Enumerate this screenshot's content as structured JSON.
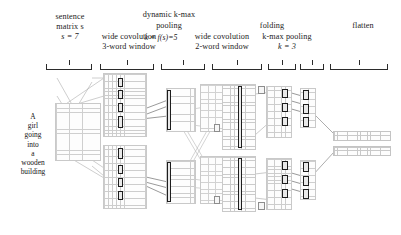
{
  "figure": {
    "type": "neural-network-architecture-diagram",
    "title_labels": {
      "sentence_matrix_l1": "sentence",
      "sentence_matrix_l2": "matrix s",
      "sentence_matrix_l3": "s = 7",
      "wide_conv_1_l1": "wide covolution",
      "wide_conv_1_l2": "3-word window",
      "dynamic_kmax_l1": "dynamic k-max",
      "dynamic_kmax_l2": "pooling",
      "dynamic_kmax_l3": "k = f(s)=5",
      "wide_conv_2_l1": "wide covolution",
      "wide_conv_2_l2": "2-word window",
      "folding": "folding",
      "kmax_pooling_l1": "k-max pooling",
      "kmax_pooling_l2": "k = 3",
      "flatten": "flatten"
    },
    "sentence_words": [
      "A",
      "girl",
      "going",
      "into",
      "a",
      "wooden",
      "building"
    ],
    "stages": [
      {
        "name": "sentence-matrix",
        "columns": 7,
        "blocks": 1
      },
      {
        "name": "wide-convolution-3-word",
        "blocks": 2
      },
      {
        "name": "dynamic-k-max-pooling",
        "k": 5,
        "blocks": 2
      },
      {
        "name": "wide-convolution-2-word",
        "blocks": 2
      },
      {
        "name": "folding",
        "blocks": 2
      },
      {
        "name": "k-max-pooling",
        "k": 3,
        "blocks": 2
      },
      {
        "name": "flatten",
        "blocks": 2
      }
    ],
    "colors": {
      "ink": "#1b1b1b",
      "grid_line": "#c9c9c9",
      "grid_fill": "#fdfdfd",
      "highlight_border": "#1d1d1d",
      "wire": "#9a9a9a",
      "bracket": "#2b2b2b"
    }
  }
}
